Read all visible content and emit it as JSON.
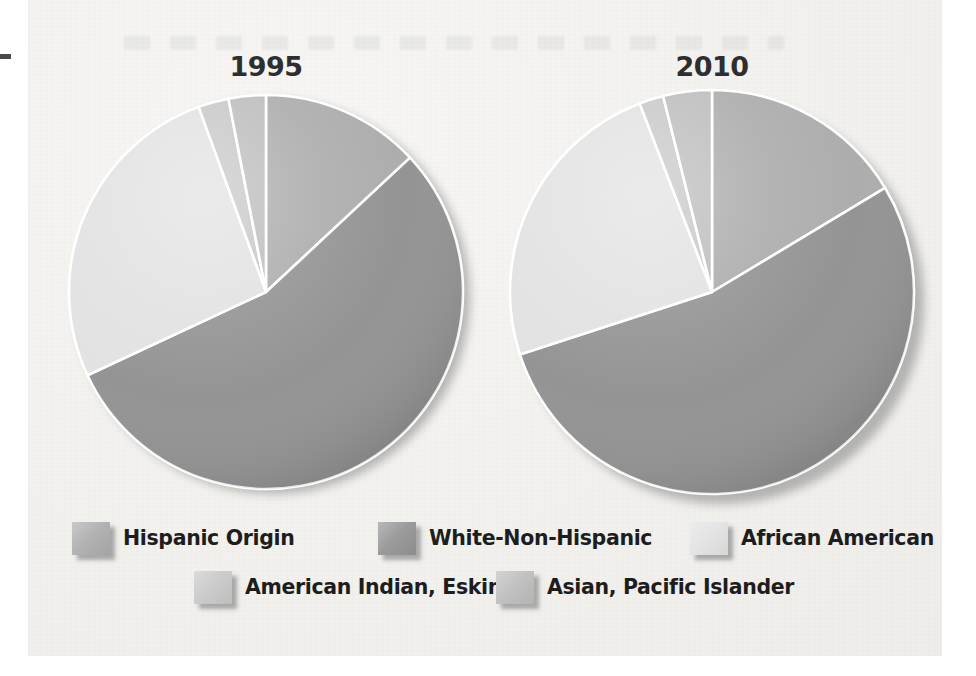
{
  "chart_data": {
    "type": "pie",
    "title": "",
    "charts": [
      {
        "title": "1995",
        "labels": [
          "Hispanic Origin",
          "White-Non-Hispanic",
          "African American",
          "American Indian, Eskimo",
          "Asian, Pacific Islander"
        ],
        "values": [
          13.0,
          55.0,
          26.4,
          2.5,
          3.1
        ],
        "unit": "percent",
        "start_angle_deg": 0,
        "direction": "clockwise",
        "boundaries_deg": [
          0,
          47,
          245,
          340,
          349,
          360
        ]
      },
      {
        "title": "2010",
        "labels": [
          "Hispanic Origin",
          "White-Non-Hispanic",
          "African American",
          "American Indian, Eskimo",
          "Asian, Pacific Islander"
        ],
        "values": [
          16.4,
          53.6,
          24.2,
          1.9,
          3.9
        ],
        "unit": "percent",
        "start_angle_deg": 0,
        "direction": "clockwise",
        "boundaries_deg": [
          0,
          59,
          252,
          339,
          346,
          360
        ]
      }
    ],
    "legend": {
      "position": "bottom",
      "entries": [
        {
          "label": "Hispanic Origin",
          "color": "#adadad"
        },
        {
          "label": "White-Non-Hispanic",
          "color": "#949494"
        },
        {
          "label": "African American",
          "color": "#e2e2e2"
        },
        {
          "label": "American Indian, Eskimo",
          "color": "#c8c8c8"
        },
        {
          "label": "Asian, Pacific Islander",
          "color": "#bdbdbd"
        }
      ]
    },
    "grid": false,
    "xlabel": "",
    "ylabel": ""
  },
  "charts": {
    "left": {
      "year": "1995"
    },
    "right": {
      "year": "2010"
    }
  },
  "legend": {
    "row1": [
      {
        "label": "Hispanic Origin",
        "color": "#adadad"
      },
      {
        "label": "White-Non-Hispanic",
        "color": "#949494"
      },
      {
        "label": "African American",
        "color": "#e2e2e2"
      }
    ],
    "row2": [
      {
        "label": "American Indian, Eskimo",
        "color": "#c8c8c8"
      },
      {
        "label": "Asian, Pacific Islander",
        "color": "#bdbdbd"
      }
    ]
  },
  "colors": {
    "hispanic": "#adadad",
    "white_non_hispanic": "#949494",
    "african_american": "#e2e2e2",
    "american_indian": "#c8c8c8",
    "asian_pacific": "#bdbdbd",
    "paper": "#f2f1ee",
    "text": "#1d1d1d",
    "slice_divider": "#ffffff"
  }
}
